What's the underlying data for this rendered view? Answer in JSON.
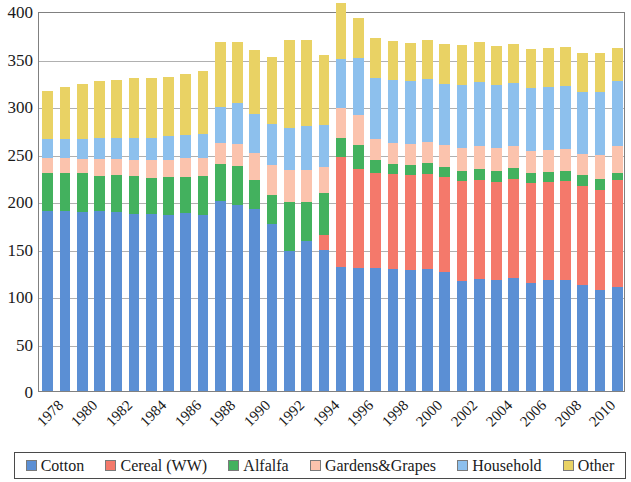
{
  "chart_data": {
    "type": "bar",
    "stacked": true,
    "title": "",
    "xlabel": "",
    "ylabel": "",
    "ylim": [
      0,
      400
    ],
    "ytick_step": 50,
    "yticks": [
      "400",
      "350",
      "300",
      "250",
      "200",
      "150",
      "100",
      "50",
      "0"
    ],
    "grid": true,
    "grid_axis": "y",
    "legend_position": "bottom",
    "categories": [
      "1978",
      "1979",
      "1980",
      "1981",
      "1982",
      "1983",
      "1984",
      "1985",
      "1986",
      "1987",
      "1988",
      "1989",
      "1990",
      "1991",
      "1992",
      "1993",
      "1994",
      "1995",
      "1996",
      "1997",
      "1998",
      "1999",
      "2000",
      "2001",
      "2002",
      "2003",
      "2004",
      "2005",
      "2006",
      "2007",
      "2008",
      "2009",
      "2010",
      "2011"
    ],
    "xtick_labels": [
      "1978",
      "",
      "1980",
      "",
      "1982",
      "",
      "1984",
      "",
      "1986",
      "",
      "1988",
      "",
      "1990",
      "",
      "1992",
      "",
      "1994",
      "",
      "1996",
      "",
      "1998",
      "",
      "2000",
      "",
      "2002",
      "",
      "2004",
      "",
      "2006",
      "",
      "2008",
      "",
      "2010",
      ""
    ],
    "series": [
      {
        "name": "Cotton",
        "color": "#5b8fd4",
        "values": [
          190,
          190,
          188,
          189,
          188,
          186,
          186,
          185,
          187,
          185,
          200,
          196,
          192,
          176,
          147,
          158,
          148,
          131,
          130,
          130,
          128,
          127,
          128,
          125,
          116,
          118,
          117,
          119,
          114,
          117,
          117,
          112,
          106,
          110
        ]
      },
      {
        "name": "Cereal (WW)",
        "color": "#f4796b",
        "values": [
          0,
          0,
          0,
          0,
          0,
          0,
          0,
          0,
          0,
          0,
          0,
          0,
          0,
          0,
          0,
          0,
          16,
          115,
          104,
          100,
          100,
          100,
          100,
          100,
          105,
          104,
          103,
          104,
          105,
          103,
          104,
          104,
          106,
          112
        ]
      },
      {
        "name": "Alfalfa",
        "color": "#43b15e",
        "values": [
          39,
          39,
          41,
          37,
          39,
          40,
          38,
          40,
          38,
          41,
          39,
          41,
          30,
          30,
          52,
          41,
          44,
          20,
          25,
          13,
          11,
          11,
          12,
          11,
          11,
          12,
          12,
          12,
          11,
          11,
          11,
          11,
          11,
          8
        ]
      },
      {
        "name": "Gardens&Grapes",
        "color": "#fbc3ad",
        "values": [
          16,
          16,
          15,
          18,
          17,
          17,
          19,
          18,
          20,
          19,
          22,
          23,
          29,
          32,
          34,
          34,
          28,
          32,
          32,
          22,
          22,
          22,
          22,
          23,
          24,
          24,
          24,
          23,
          23,
          23,
          23,
          22,
          26,
          28
        ]
      },
      {
        "name": "Household",
        "color": "#8dc0ed",
        "values": [
          20,
          20,
          21,
          22,
          22,
          23,
          23,
          25,
          25,
          26,
          38,
          43,
          41,
          43,
          44,
          46,
          44,
          52,
          60,
          65,
          66,
          66,
          66,
          64,
          66,
          67,
          66,
          66,
          66,
          66,
          66,
          66,
          66,
          68
        ]
      },
      {
        "name": "Other",
        "color": "#e9d264",
        "values": [
          51,
          55,
          58,
          60,
          61,
          64,
          64,
          63,
          64,
          66,
          68,
          64,
          67,
          71,
          92,
          90,
          74,
          58,
          42,
          42,
          41,
          40,
          42,
          42,
          42,
          42,
          41,
          41,
          41,
          41,
          41,
          41,
          41,
          35
        ]
      }
    ]
  },
  "legend": {
    "items": [
      {
        "label": "Cotton",
        "color": "#5b8fd4"
      },
      {
        "label": "Cereal (WW)",
        "color": "#f4796b"
      },
      {
        "label": "Alfalfa",
        "color": "#43b15e"
      },
      {
        "label": "Gardens&Grapes",
        "color": "#fbc3ad"
      },
      {
        "label": "Household",
        "color": "#8dc0ed"
      },
      {
        "label": "Other",
        "color": "#e9d264"
      }
    ]
  }
}
